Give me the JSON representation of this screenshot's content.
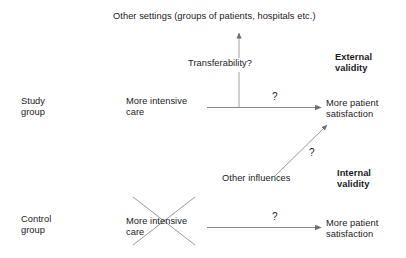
{
  "diagram": {
    "title_text": "Other settings (groups of patients, hospitals etc.)",
    "nodes": {
      "other_settings": "Other settings (groups of patients, hospitals etc.)",
      "transferability": "Transferability?",
      "external_validity": "External\nvalidity",
      "study_group": "Study\ngroup",
      "study_cause": "More intensive\ncare",
      "study_effect": "More patient\nsatisfaction",
      "other_influences": "Other influences",
      "internal_validity": "Internal\nvalidity",
      "control_group": "Control\ngroup",
      "control_cause": "More intensive\ncare",
      "control_effect": "More patient\nsatisfaction"
    },
    "edge_labels": {
      "study_arrow_question": "?",
      "control_arrow_question": "?",
      "diagonal_arrow_question": "?"
    },
    "colors": {
      "background": "#ffffff",
      "text": "#1a1a1a",
      "line": "#7a7a7a",
      "cross": "#8a8a8a"
    },
    "icons": {
      "study_arrow": "arrow-right-icon",
      "control_arrow": "arrow-right-icon",
      "transferability_arrow": "arrow-up-icon",
      "influences_arrow": "arrow-diagonal-up-right-icon",
      "crossed_out": "cross-out-icon"
    }
  }
}
